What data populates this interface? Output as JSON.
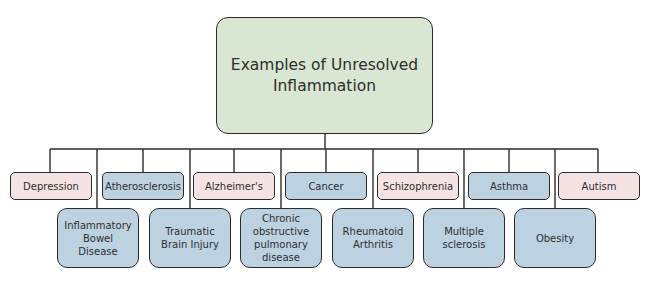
{
  "diagram": {
    "title": "Examples of Unresolved Inflammation",
    "colors": {
      "root_fill": "#d9e6d2",
      "pink_fill": "#f5e3e3",
      "blue_fill": "#bdd2e1",
      "stroke": "#2b2b2b"
    },
    "top_row": [
      {
        "label": "Depression",
        "color": "pink"
      },
      {
        "label": "Atherosclerosis",
        "color": "blue"
      },
      {
        "label": "Alzheimer's",
        "color": "pink"
      },
      {
        "label": "Cancer",
        "color": "blue"
      },
      {
        "label": "Schizophrenia",
        "color": "pink"
      },
      {
        "label": "Asthma",
        "color": "blue"
      },
      {
        "label": "Autism",
        "color": "pink"
      }
    ],
    "bottom_row": [
      {
        "label": "Inflammatory Bowel Disease",
        "color": "blue"
      },
      {
        "label": "Traumatic Brain Injury",
        "color": "blue"
      },
      {
        "label": "Chronic obstructive pulmonary disease",
        "color": "blue"
      },
      {
        "label": "Rheumatoid Arthritis",
        "color": "blue"
      },
      {
        "label": "Multiple sclerosis",
        "color": "blue"
      },
      {
        "label": "Obesity",
        "color": "blue"
      }
    ]
  }
}
